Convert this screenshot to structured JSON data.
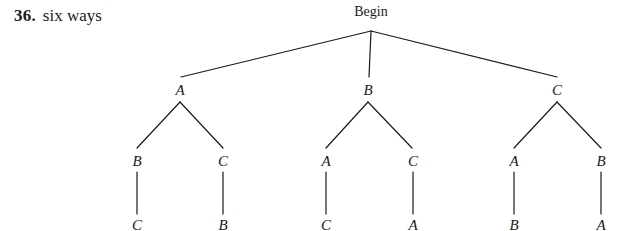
{
  "caption": {
    "number": "36.",
    "text": "six ways"
  },
  "tree": {
    "root": {
      "label": "Begin",
      "x": 371,
      "y": 4
    },
    "level2": [
      {
        "label": "A",
        "x": 180,
        "y": 82
      },
      {
        "label": "B",
        "x": 368,
        "y": 82
      },
      {
        "label": "C",
        "x": 557,
        "y": 82
      }
    ],
    "level3": [
      {
        "label": "B",
        "x": 137,
        "y": 153
      },
      {
        "label": "C",
        "x": 223,
        "y": 153
      },
      {
        "label": "A",
        "x": 326,
        "y": 153
      },
      {
        "label": "C",
        "x": 413,
        "y": 153
      },
      {
        "label": "A",
        "x": 514,
        "y": 153
      },
      {
        "label": "B",
        "x": 601,
        "y": 153
      }
    ],
    "level4": [
      {
        "label": "C",
        "x": 137,
        "y": 217
      },
      {
        "label": "B",
        "x": 223,
        "y": 217
      },
      {
        "label": "C",
        "x": 326,
        "y": 217
      },
      {
        "label": "A",
        "x": 413,
        "y": 217
      },
      {
        "label": "B",
        "x": 514,
        "y": 217
      },
      {
        "label": "A",
        "x": 601,
        "y": 217
      }
    ],
    "edges": {
      "root_fan": [
        {
          "x1": 371,
          "y1": 31,
          "x2": 181,
          "y2": 77
        },
        {
          "x1": 371,
          "y1": 31,
          "x2": 369,
          "y2": 77
        },
        {
          "x1": 371,
          "y1": 31,
          "x2": 557,
          "y2": 77
        }
      ],
      "branch_fan": [
        {
          "x1": 180,
          "y1": 102,
          "x2": 137,
          "y2": 148
        },
        {
          "x1": 180,
          "y1": 102,
          "x2": 223,
          "y2": 148
        },
        {
          "x1": 368,
          "y1": 102,
          "x2": 326,
          "y2": 148
        },
        {
          "x1": 368,
          "y1": 102,
          "x2": 412,
          "y2": 148
        },
        {
          "x1": 557,
          "y1": 102,
          "x2": 514,
          "y2": 148
        },
        {
          "x1": 557,
          "y1": 102,
          "x2": 601,
          "y2": 148
        }
      ],
      "verticals": [
        {
          "x1": 137,
          "y1": 172,
          "x2": 137,
          "y2": 214
        },
        {
          "x1": 223,
          "y1": 172,
          "x2": 223,
          "y2": 214
        },
        {
          "x1": 326,
          "y1": 172,
          "x2": 326,
          "y2": 214
        },
        {
          "x1": 413,
          "y1": 172,
          "x2": 413,
          "y2": 214
        },
        {
          "x1": 514,
          "y1": 172,
          "x2": 514,
          "y2": 214
        },
        {
          "x1": 601,
          "y1": 172,
          "x2": 601,
          "y2": 214
        }
      ]
    },
    "stroke_color": "#1a1a1a"
  },
  "chart_data": {
    "type": "diagram",
    "title": "six ways",
    "root": "Begin",
    "paths": [
      [
        "A",
        "B",
        "C"
      ],
      [
        "A",
        "C",
        "B"
      ],
      [
        "B",
        "A",
        "C"
      ],
      [
        "B",
        "C",
        "A"
      ],
      [
        "C",
        "A",
        "B"
      ],
      [
        "C",
        "B",
        "A"
      ]
    ]
  }
}
